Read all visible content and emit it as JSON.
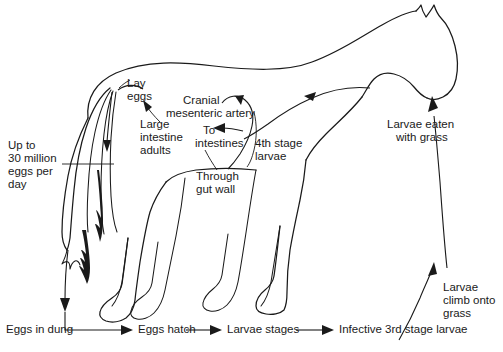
{
  "diagram": {
    "type": "life-cycle-diagram",
    "line_color": "#1a1a1a",
    "background_color": "#ffffff",
    "labels": {
      "lay_eggs": "Lay\neggs",
      "lay_eggs_line1": "Lay",
      "lay_eggs_line2": "eggs",
      "large_intestine_adults": "Large\nintestine\nadults",
      "large_intestine_line1": "Large",
      "large_intestine_line2": "intestine",
      "large_intestine_line3": "adults",
      "cranial_mesenteric_artery": "Cranial\nmesenteric artery",
      "cranial_line1": "Cranial",
      "cranial_line2": "mesenteric artery",
      "to_intestines": "To\nintestines",
      "to_intestines_line1": "To",
      "to_intestines_line2": "intestines",
      "fourth_stage_larvae": "4th stage\nlarvae",
      "fourth_stage_line1": "4th stage",
      "fourth_stage_line2": "larvae",
      "through_gut_wall": "Through\ngut wall",
      "through_gut_line1": "Through",
      "through_gut_line2": "gut wall",
      "larvae_eaten_with_grass": "Larvae eaten\nwith grass",
      "larvae_eaten_line1": "Larvae eaten",
      "larvae_eaten_line2": "with grass",
      "larvae_climb_onto_grass": "Larvae\nclimb onto\ngrass",
      "larvae_climb_line1": "Larvae",
      "larvae_climb_line2": "climb onto",
      "larvae_climb_line3": "grass",
      "eggs_per_day": "Up to\n30 million\neggs per\nday",
      "eggs_per_day_line1": "Up to",
      "eggs_per_day_line2": "30 million",
      "eggs_per_day_line3": "eggs per",
      "eggs_per_day_line4": "day"
    },
    "flow_chain": {
      "steps": [
        {
          "id": "eggs-in-dung",
          "label": "Eggs in dung"
        },
        {
          "id": "eggs-hatch",
          "label": "Eggs hatch"
        },
        {
          "id": "larvae-stages",
          "label": "Larvae stages"
        },
        {
          "id": "infective-3rd-stage-larvae",
          "label": "Infective 3rd stage larvae"
        }
      ]
    },
    "stats": {
      "eggs_per_day_value": "30 million",
      "eggs_per_day_qualifier": "Up to",
      "eggs_per_day_unit": "eggs per day"
    }
  }
}
